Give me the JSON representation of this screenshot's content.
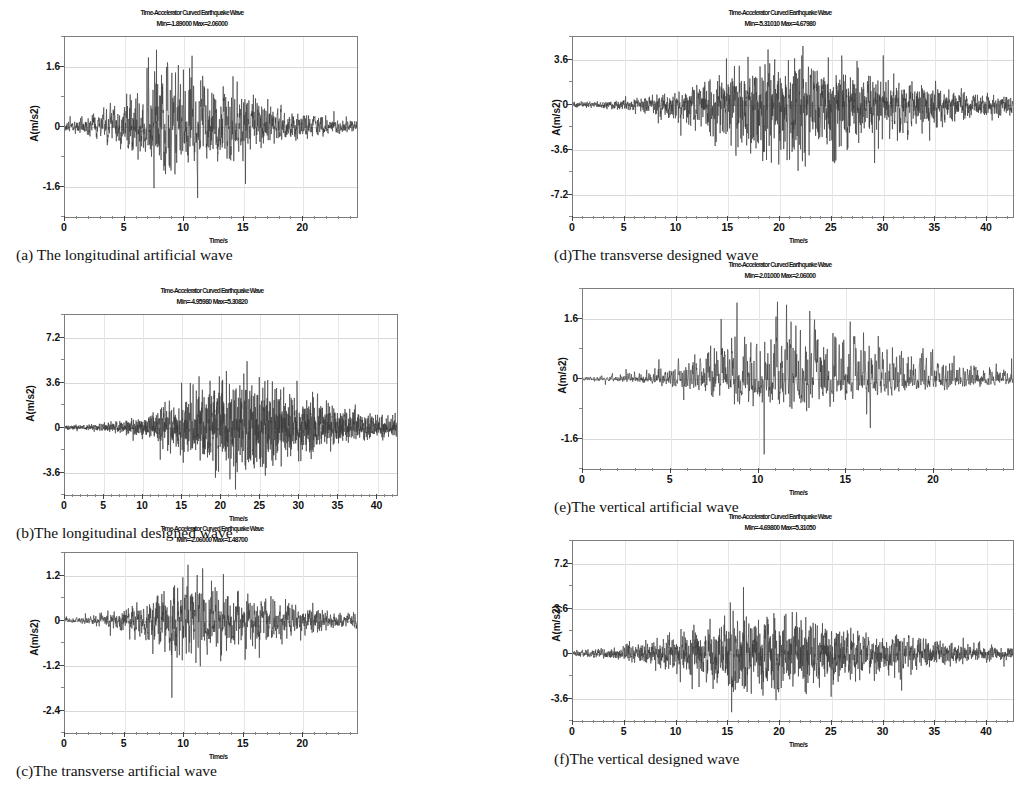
{
  "figure": {
    "common_chart_title": "Time-Accelerator Curved Earthquake Wave",
    "ylabel": "A(m/s2)",
    "xlabel": "Time/s"
  },
  "panels": [
    {
      "id": "a",
      "caption": "(a) The longitudinal artificial wave",
      "title": "Time-Accelerator Curved Earthquake Wave",
      "minmax": "Min=-1.89000 Max=2.06000",
      "min": -1.89,
      "max": 2.06,
      "ylabel": "A(m/s2)",
      "xlabel": "Time/s",
      "yticks": [
        1.6,
        0,
        -1.6
      ],
      "ytick_labels": [
        "1.6",
        "0",
        "-1.6"
      ],
      "ylim": [
        -2.4,
        2.4
      ],
      "xticks": [
        0,
        5,
        10,
        15,
        20
      ],
      "xtick_labels": [
        "0",
        "5",
        "10",
        "15",
        "20"
      ],
      "xlim": [
        0,
        24.5
      ]
    },
    {
      "id": "b",
      "caption": "(b)The longitudinal designed wave",
      "title": "Time-Accelerator Curved Earthquake Wave",
      "minmax": "Min=-4.95980 Max=5.30820",
      "min": -4.9598,
      "max": 5.3082,
      "ylabel": "A(m/s2)",
      "xlabel": "Time/s",
      "yticks": [
        7.2,
        3.6,
        0,
        -3.6
      ],
      "ytick_labels": [
        "7.2",
        "3.6",
        "0",
        "-3.6"
      ],
      "ylim": [
        -5.4,
        9.0
      ],
      "xticks": [
        0,
        5,
        10,
        15,
        20,
        25,
        30,
        35,
        40
      ],
      "xtick_labels": [
        "0",
        "5",
        "10",
        "15",
        "20",
        "25",
        "30",
        "35",
        "40"
      ],
      "xlim": [
        0,
        42.5
      ]
    },
    {
      "id": "c",
      "caption": "(c)The transverse artificial wave",
      "title": "Time-Accelerator Curved Earthquake Wave",
      "minmax": "Min=-2.06000 Max=1.48700",
      "min": -2.06,
      "max": 1.487,
      "ylabel": "A(m/s2)",
      "xlabel": "Time/s",
      "yticks": [
        1.2,
        0,
        -1.2,
        -2.4
      ],
      "ytick_labels": [
        "1.2",
        "0",
        "-1.2",
        "-2.4"
      ],
      "ylim": [
        -3.0,
        1.8
      ],
      "xticks": [
        0,
        5,
        10,
        15,
        20
      ],
      "xtick_labels": [
        "0",
        "5",
        "10",
        "15",
        "20"
      ],
      "xlim": [
        0,
        24.5
      ]
    },
    {
      "id": "d",
      "caption": "(d)The transverse designed wave",
      "title": "Time-Accelerator Curved Earthquake Wave",
      "minmax": "Min=-5.31010 Max=4.67980",
      "min": -5.3101,
      "max": 4.6798,
      "ylabel": "A(m/s2)",
      "xlabel": "Time/s",
      "yticks": [
        3.6,
        0,
        -3.6,
        -7.2
      ],
      "ytick_labels": [
        "3.6",
        "0",
        "-3.6",
        "-7.2"
      ],
      "ylim": [
        -9.0,
        5.4
      ],
      "xticks": [
        0,
        5,
        10,
        15,
        20,
        25,
        30,
        35,
        40
      ],
      "xtick_labels": [
        "0",
        "5",
        "10",
        "15",
        "20",
        "25",
        "30",
        "35",
        "40"
      ],
      "xlim": [
        0,
        42.5
      ]
    },
    {
      "id": "e",
      "caption": "(e)The vertical artificial wave",
      "title": "Time-Accelerator Curved Earthquake Wave",
      "minmax": "Min=-2.01000 Max=2.06000",
      "min": -2.01,
      "max": 2.06,
      "ylabel": "A(m/s2)",
      "xlabel": "Time/s",
      "yticks": [
        1.6,
        0,
        -1.6
      ],
      "ytick_labels": [
        "1.6",
        "0",
        "-1.6"
      ],
      "ylim": [
        -2.4,
        2.4
      ],
      "xticks": [
        0,
        5,
        10,
        15,
        20
      ],
      "xtick_labels": [
        "0",
        "5",
        "10",
        "15",
        "20"
      ],
      "xlim": [
        0,
        24.5
      ]
    },
    {
      "id": "f",
      "caption": "(f)The vertical designed wave",
      "title": "Time-Accelerator Curved Earthquake Wave",
      "minmax": "Min=-4.69800 Max=5.31050",
      "min": -4.698,
      "max": 5.3105,
      "ylabel": "A(m/s2)",
      "xlabel": "Time/s",
      "yticks": [
        7.2,
        3.6,
        0,
        -3.6
      ],
      "ytick_labels": [
        "7.2",
        "3.6",
        "0",
        "-3.6"
      ],
      "ylim": [
        -5.4,
        9.0
      ],
      "xticks": [
        0,
        5,
        10,
        15,
        20,
        25,
        30,
        35,
        40
      ],
      "xtick_labels": [
        "0",
        "5",
        "10",
        "15",
        "20",
        "25",
        "30",
        "35",
        "40"
      ],
      "xlim": [
        0,
        42.5
      ]
    }
  ],
  "chart_data": {
    "type": "line",
    "shared": {
      "title": "Time-Accelerator Curved Earthquake Wave",
      "xlabel": "Time/s",
      "ylabel": "A(m/s2)",
      "grid": true,
      "legend": "none"
    },
    "series": [
      {
        "name": "(a) The longitudinal artificial wave",
        "xlim": [
          0,
          24.5
        ],
        "ylim": [
          -2.4,
          2.4
        ],
        "yticks": [
          1.6,
          0,
          -1.6
        ],
        "xticks": [
          0,
          5,
          10,
          15,
          20
        ],
        "min": -1.89,
        "max": 2.06,
        "duration_s": 24.5,
        "envelope_peak_time_s": 9.0
      },
      {
        "name": "(b) The longitudinal designed wave",
        "xlim": [
          0,
          42.5
        ],
        "ylim": [
          -5.4,
          9.0
        ],
        "yticks": [
          7.2,
          3.6,
          0,
          -3.6
        ],
        "xticks": [
          0,
          5,
          10,
          15,
          20,
          25,
          30,
          35,
          40
        ],
        "min": -4.9598,
        "max": 5.3082,
        "duration_s": 42.5,
        "envelope_peak_time_s": 21.0
      },
      {
        "name": "(c) The transverse artificial wave",
        "xlim": [
          0,
          24.5
        ],
        "ylim": [
          -3.0,
          1.8
        ],
        "yticks": [
          1.2,
          0,
          -1.2,
          -2.4
        ],
        "xticks": [
          0,
          5,
          10,
          15,
          20
        ],
        "min": -2.06,
        "max": 1.487,
        "duration_s": 24.5,
        "envelope_peak_time_s": 10.5
      },
      {
        "name": "(d) The transverse designed wave",
        "xlim": [
          0,
          42.5
        ],
        "ylim": [
          -9.0,
          5.4
        ],
        "yticks": [
          3.6,
          0,
          -3.6,
          -7.2
        ],
        "xticks": [
          0,
          5,
          10,
          15,
          20,
          25,
          30,
          35,
          40
        ],
        "min": -5.3101,
        "max": 4.6798,
        "duration_s": 42.5,
        "envelope_peak_time_s": 20.0
      },
      {
        "name": "(e) The vertical artificial wave",
        "xlim": [
          0,
          24.5
        ],
        "ylim": [
          -2.4,
          2.4
        ],
        "yticks": [
          1.6,
          0,
          -1.6
        ],
        "xticks": [
          0,
          5,
          10,
          15,
          20
        ],
        "min": -2.01,
        "max": 2.06,
        "duration_s": 24.5,
        "envelope_peak_time_s": 11.0
      },
      {
        "name": "(f) The vertical designed wave",
        "xlim": [
          0,
          42.5
        ],
        "ylim": [
          -5.4,
          9.0
        ],
        "yticks": [
          7.2,
          3.6,
          0,
          -3.6
        ],
        "xticks": [
          0,
          5,
          10,
          15,
          20,
          25,
          30,
          35,
          40
        ],
        "min": -4.698,
        "max": 5.3105,
        "duration_s": 42.5,
        "envelope_peak_time_s": 17.0
      }
    ]
  }
}
